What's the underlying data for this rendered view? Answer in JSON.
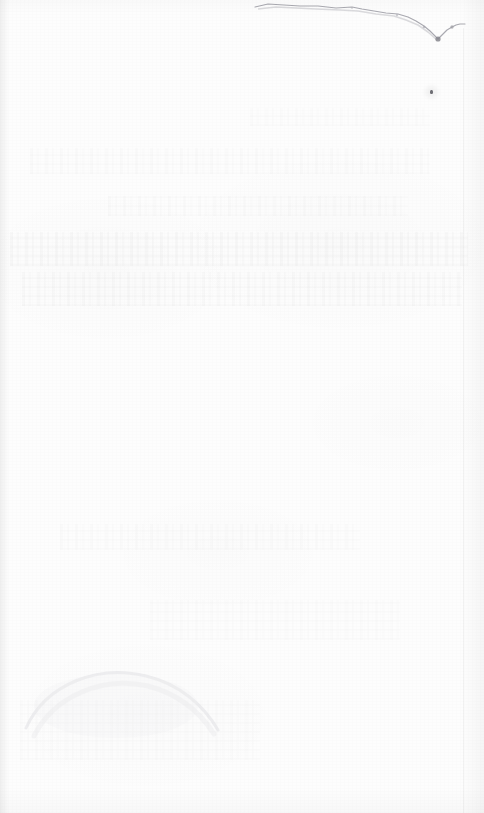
{
  "document": {
    "kind": "scanned-page",
    "side": "blank-verso",
    "width_px": 484,
    "height_px": 813,
    "visible_text": "",
    "caption": ""
  },
  "page": {
    "paper_color": "#fdfdfd",
    "background_color": "#ffffff",
    "ink_color": "#9a9aa0"
  },
  "artifacts": {
    "torn_top_edge": {
      "name": "torn-top-edge",
      "color": "#a9a9b0",
      "starts_x": 255,
      "ends_x": 465,
      "notch_vertex_x": 438,
      "notch_vertex_y": 38
    },
    "speck": {
      "name": "dark-speck",
      "x": 431,
      "y": 92,
      "color": "#6e6e74"
    },
    "bleed_through": {
      "name": "bleed-through-ghost-text",
      "color": "#cfcfd4",
      "bands": 8
    },
    "smudge": {
      "name": "arc-smudge",
      "x": 20,
      "y": 650,
      "color": "#d8d8dc"
    },
    "edge_shadows": {
      "left": "#000000",
      "right": "#000000",
      "bottom": "#000000"
    }
  }
}
